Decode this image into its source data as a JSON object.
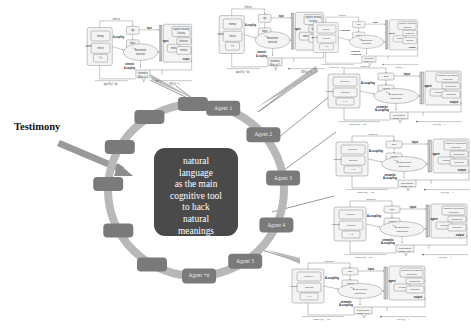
{
  "figure": {
    "background_color": "#ffffff",
    "annotation": {
      "label": "Testimony"
    },
    "center": {
      "fill_color": "#4a4a4a",
      "lines": [
        "natural",
        "language",
        "as the main",
        "cognitive tool",
        "to hack",
        "natural",
        "meanings"
      ]
    },
    "ring": {
      "ring_color": "#b8b8b8",
      "node_color": "#7a7a7a",
      "node_count": 12,
      "nodes": [
        {
          "label": "Agent 1",
          "labeled": true
        },
        {
          "label": "Agent 2",
          "labeled": true
        },
        {
          "label": "Agent 3",
          "labeled": true
        },
        {
          "label": "Agent 4",
          "labeled": true
        },
        {
          "label": "Agent 5",
          "labeled": true
        },
        {
          "label": "Agent +n",
          "labeled": true
        },
        {
          "label": "",
          "labeled": false
        },
        {
          "label": "",
          "labeled": false
        },
        {
          "label": "",
          "labeled": false
        },
        {
          "label": "",
          "labeled": false
        },
        {
          "label": "",
          "labeled": false
        },
        {
          "label": "",
          "labeled": false
        }
      ]
    },
    "subdiagram_template": {
      "left_block": {
        "outer_label": "context",
        "boxes": [
          "memory",
          "interest",
          "I / it"
        ]
      },
      "top_label": "refers to",
      "mid_labels": {
        "upper": "A-coupling",
        "lower": "semantic\nA-coupling"
      },
      "ellipse_label": "sensorimotor\ninteraction",
      "sign_box": "sign",
      "object_box": "object",
      "input_label": "input",
      "agent_label": "agent",
      "right_block": {
        "boxes": [
          "cognitive meaning & tooling",
          "behaviour",
          "media",
          "interface"
        ],
        "output_label": "output"
      },
      "bottom_labels": {
        "information": "information",
        "what_is_it": "What is it ?",
        "left_formula": "lapis P(x) = kte",
        "right_formula": "P(P(x)) = 1"
      }
    },
    "subdiagrams": [
      {
        "id": "sd-top-left",
        "x": 84,
        "y": 12,
        "w": 110,
        "h": 78
      },
      {
        "id": "sd-top-right",
        "x": 216,
        "y": 0,
        "w": 110,
        "h": 78
      },
      {
        "id": "sd-right-1",
        "x": 310,
        "y": 10,
        "w": 110,
        "h": 62
      },
      {
        "id": "sd-right-2",
        "x": 324,
        "y": 60,
        "w": 140,
        "h": 70
      },
      {
        "id": "sd-right-3",
        "x": 332,
        "y": 128,
        "w": 140,
        "h": 70
      },
      {
        "id": "sd-right-4",
        "x": 330,
        "y": 193,
        "w": 140,
        "h": 70
      },
      {
        "id": "sd-bottom",
        "x": 288,
        "y": 255,
        "w": 140,
        "h": 70
      }
    ],
    "connectors": [
      {
        "from": "Agent 1",
        "to": "sd-top-left"
      },
      {
        "from": "Agent 2",
        "to": "sd-top-right"
      },
      {
        "from": "Agent 2",
        "to": "sd-right-1"
      },
      {
        "from": "Agent 3",
        "to": "sd-right-2"
      },
      {
        "from": "Agent 4",
        "to": "sd-right-3"
      },
      {
        "from": "Agent 5",
        "to": "sd-right-4"
      },
      {
        "from": "Agent +n",
        "to": "sd-bottom"
      }
    ]
  }
}
